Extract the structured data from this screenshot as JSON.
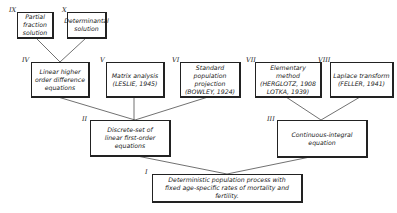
{
  "diagram": {
    "nodes": [
      {
        "id": "IX",
        "numeral": "IX",
        "label": "Partial\nfraction\nsolution"
      },
      {
        "id": "X",
        "numeral": "X",
        "label": "Determinantal\nsolution"
      },
      {
        "id": "IV",
        "numeral": "IV",
        "label": "Linear higher\norder difference\nequations"
      },
      {
        "id": "V",
        "numeral": "V",
        "label": "Matrix analysis\n(LESLIE, 1945)"
      },
      {
        "id": "VI",
        "numeral": "VI",
        "label": "Standard population\nprojection\n(BOWLEY, 1924)"
      },
      {
        "id": "VII",
        "numeral": "VII",
        "label": "Elementary method\n(HERGLOTZ, 1908\nLOTKA, 1939)"
      },
      {
        "id": "VIII",
        "numeral": "VIII",
        "label": "Laplace transform\n(FELLER, 1941)"
      },
      {
        "id": "II",
        "numeral": "II",
        "label": "Discrete-set of\nlinear first-order equations"
      },
      {
        "id": "III",
        "numeral": "III",
        "label": "Continuous-integral\nequation"
      },
      {
        "id": "I",
        "numeral": "I",
        "label": "Deterministic population process with\nfixed age-specific rates of mortality and fertility."
      }
    ],
    "edges": [
      [
        "IX",
        "IV"
      ],
      [
        "X",
        "IV"
      ],
      [
        "IV",
        "II"
      ],
      [
        "V",
        "II"
      ],
      [
        "VI",
        "II"
      ],
      [
        "VII",
        "III"
      ],
      [
        "VIII",
        "III"
      ],
      [
        "II",
        "I"
      ],
      [
        "III",
        "I"
      ]
    ]
  }
}
